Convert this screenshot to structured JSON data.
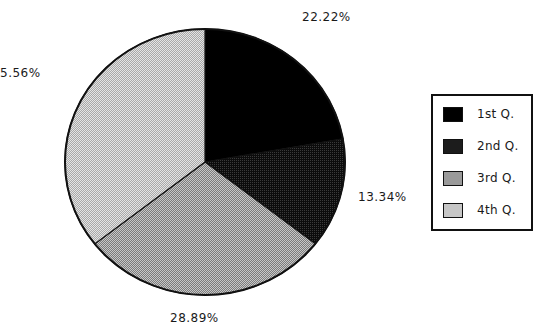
{
  "chart_data": {
    "type": "pie",
    "title": "",
    "categories": [
      "1st Q.",
      "2nd Q.",
      "3rd Q.",
      "4th Q."
    ],
    "values": [
      22.22,
      13.34,
      28.89,
      35.56
    ],
    "value_labels": [
      "22.22%",
      "13.34%",
      "28.89%",
      "35.56%"
    ],
    "colors": [
      "#000000",
      "#222222",
      "#9a9a9a",
      "#c4c4c4"
    ],
    "start_angle_deg": 0,
    "direction": "clockwise",
    "legend_position": "right"
  },
  "labels": {
    "q1": "22.22%",
    "q2": "13.34%",
    "q3": "28.89%",
    "q4": "5.56%"
  },
  "legend": {
    "items": [
      {
        "label": "1st Q.",
        "color": "#000000"
      },
      {
        "label": "2nd Q.",
        "color": "#222222"
      },
      {
        "label": "3rd Q.",
        "color": "#9a9a9a"
      },
      {
        "label": "4th Q.",
        "color": "#c4c4c4"
      }
    ]
  }
}
